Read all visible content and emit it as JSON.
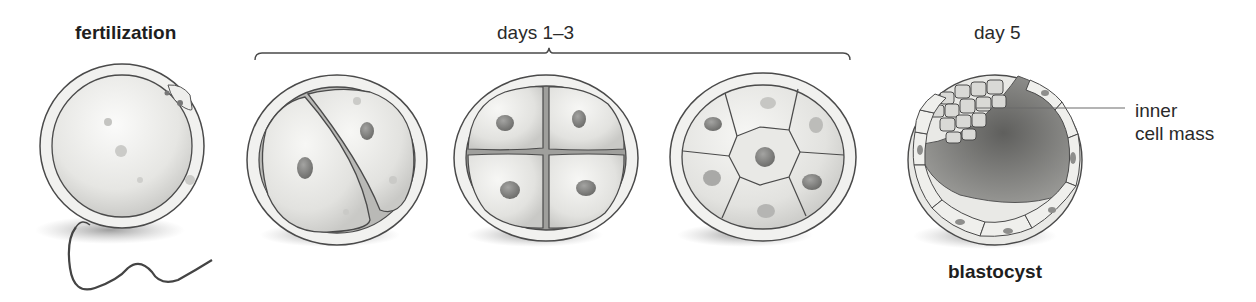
{
  "diagram": {
    "stages": [
      {
        "id": "fertilization",
        "label": "fertilization",
        "description": "egg with sperm attached",
        "cells": 1
      },
      {
        "id": "two-cell",
        "label": "",
        "description": "2-cell stage",
        "cells": 2
      },
      {
        "id": "four-cell",
        "label": "",
        "description": "4-cell stage",
        "cells": 4
      },
      {
        "id": "multi-cell",
        "label": "",
        "description": "multi-cell stage (hexagonal cleavage)",
        "cells": 7
      },
      {
        "id": "blastocyst",
        "label": "blastocyst",
        "description": "hollow ball of cells with inner cell mass",
        "cells": 0
      }
    ],
    "bracket_label": "days 1–3",
    "day5_label": "day 5",
    "callout": {
      "line1": "inner",
      "line2": "cell mass"
    }
  },
  "colors": {
    "outline": "#4a4a4a",
    "membrane": "#f1f1ef",
    "cell_fill": "#e6e6e3",
    "nucleus": "#8a8a88",
    "shadow": "#9a9a9a",
    "cavity": "#6b6b69"
  }
}
